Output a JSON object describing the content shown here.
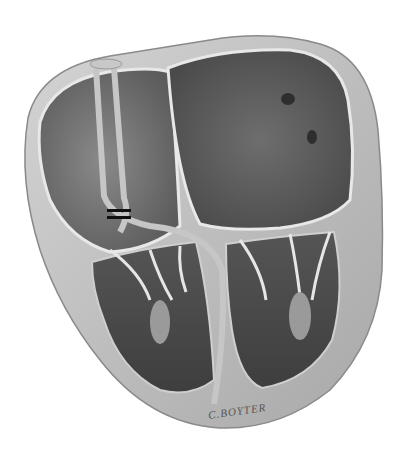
{
  "illustration": {
    "subject": "heart cross-section with pacemaker leads",
    "signature": "C.BOYTER",
    "colors": {
      "background": "#ffffff",
      "wall": "#b8b8b8",
      "wall_light": "#d8d8d8",
      "chamber_dark": "#5a5a5a",
      "chamber_mid": "#7a7a7a",
      "lead": "#c4c4c4",
      "marker": "#111111"
    }
  }
}
